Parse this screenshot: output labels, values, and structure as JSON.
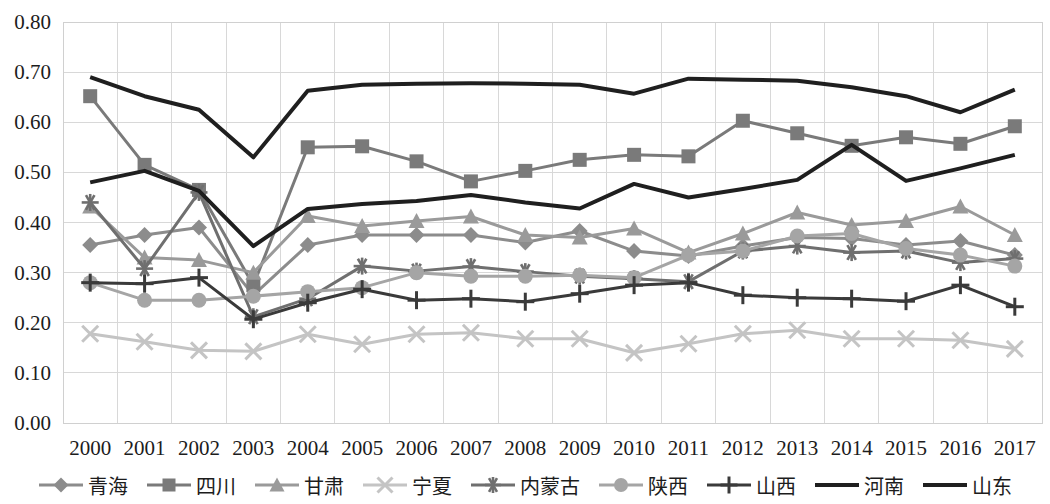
{
  "chart_data": {
    "type": "line",
    "title": "",
    "xlabel": "",
    "ylabel": "",
    "grid": true,
    "legend_position": "bottom",
    "ylim": [
      0.0,
      0.8
    ],
    "y_ticks": [
      "0.00",
      "0.10",
      "0.20",
      "0.30",
      "0.40",
      "0.50",
      "0.60",
      "0.70",
      "0.80"
    ],
    "y_tick_values": [
      0.0,
      0.1,
      0.2,
      0.3,
      0.4,
      0.5,
      0.6,
      0.7,
      0.8
    ],
    "categories": [
      "2000",
      "2001",
      "2002",
      "2003",
      "2004",
      "2005",
      "2006",
      "2007",
      "2008",
      "2009",
      "2010",
      "2011",
      "2012",
      "2013",
      "2014",
      "2015",
      "2016",
      "2017"
    ],
    "x": [
      2000,
      2001,
      2002,
      2003,
      2004,
      2005,
      2006,
      2007,
      2008,
      2009,
      2010,
      2011,
      2012,
      2013,
      2014,
      2015,
      2016,
      2017
    ],
    "series": [
      {
        "name": "青海",
        "marker": "diamond",
        "color": "#8c8c8c",
        "width": 3,
        "values": [
          0.355,
          0.375,
          0.39,
          0.255,
          0.355,
          0.375,
          0.375,
          0.375,
          0.36,
          0.383,
          0.343,
          0.333,
          0.353,
          0.37,
          0.368,
          0.355,
          0.363,
          0.335
        ]
      },
      {
        "name": "四川",
        "marker": "square",
        "color": "#7a7a7a",
        "width": 3,
        "values": [
          0.652,
          0.515,
          0.465,
          0.275,
          0.55,
          0.552,
          0.522,
          0.482,
          0.503,
          0.525,
          0.535,
          0.532,
          0.603,
          0.578,
          0.553,
          0.57,
          0.557,
          0.592
        ]
      },
      {
        "name": "甘肃",
        "marker": "triangle",
        "color": "#9a9a9a",
        "width": 3,
        "values": [
          0.432,
          0.33,
          0.325,
          0.3,
          0.413,
          0.393,
          0.403,
          0.412,
          0.375,
          0.37,
          0.388,
          0.34,
          0.378,
          0.42,
          0.395,
          0.403,
          0.432,
          0.375
        ]
      },
      {
        "name": "宁夏",
        "marker": "x",
        "color": "#c4c4c4",
        "width": 3,
        "values": [
          0.178,
          0.162,
          0.145,
          0.143,
          0.177,
          0.157,
          0.177,
          0.18,
          0.168,
          0.168,
          0.14,
          0.158,
          0.178,
          0.185,
          0.168,
          0.168,
          0.165,
          0.148
        ]
      },
      {
        "name": "内蒙古",
        "marker": "star",
        "color": "#6f6f6f",
        "width": 3,
        "values": [
          0.44,
          0.308,
          0.46,
          0.212,
          0.248,
          0.313,
          0.303,
          0.312,
          0.302,
          0.293,
          0.288,
          0.282,
          0.343,
          0.353,
          0.34,
          0.343,
          0.32,
          0.328
        ]
      },
      {
        "name": "陕西",
        "marker": "circle",
        "color": "#a5a5a5",
        "width": 3,
        "values": [
          0.28,
          0.245,
          0.245,
          0.253,
          0.262,
          0.27,
          0.3,
          0.293,
          0.293,
          0.295,
          0.29,
          0.335,
          0.343,
          0.373,
          0.378,
          0.348,
          0.335,
          0.313
        ]
      },
      {
        "name": "山西",
        "marker": "plus",
        "color": "#3a3a3a",
        "width": 3,
        "values": [
          0.28,
          0.278,
          0.29,
          0.207,
          0.24,
          0.267,
          0.245,
          0.248,
          0.242,
          0.258,
          0.275,
          0.28,
          0.255,
          0.25,
          0.248,
          0.243,
          0.275,
          0.232
        ]
      },
      {
        "name": "河南",
        "marker": "none",
        "color": "#1f1f1f",
        "width": 4,
        "values": [
          0.69,
          0.652,
          0.625,
          0.53,
          0.663,
          0.675,
          0.677,
          0.678,
          0.677,
          0.675,
          0.657,
          0.687,
          0.685,
          0.683,
          0.67,
          0.652,
          0.62,
          0.665
        ]
      },
      {
        "name": "山东",
        "marker": "none",
        "color": "#1f1f1f",
        "width": 4,
        "values": [
          0.48,
          0.503,
          0.463,
          0.353,
          0.427,
          0.437,
          0.443,
          0.455,
          0.44,
          0.428,
          0.477,
          0.45,
          0.467,
          0.485,
          0.555,
          0.483,
          0.508,
          0.535
        ]
      }
    ]
  },
  "legend": {
    "items": [
      {
        "label": "青海"
      },
      {
        "label": "四川"
      },
      {
        "label": "甘肃"
      },
      {
        "label": "宁夏"
      },
      {
        "label": "内蒙古"
      },
      {
        "label": "陕西"
      },
      {
        "label": "山西"
      },
      {
        "label": "河南"
      },
      {
        "label": "山东"
      }
    ]
  }
}
